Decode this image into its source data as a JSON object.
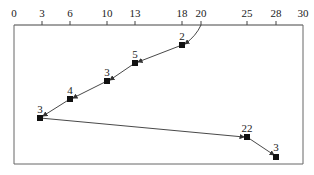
{
  "axis": {
    "ticks": [
      {
        "value": "0",
        "x": 14
      },
      {
        "value": "3",
        "x": 42
      },
      {
        "value": "6",
        "x": 70
      },
      {
        "value": "10",
        "x": 107
      },
      {
        "value": "13",
        "x": 135
      },
      {
        "value": "18",
        "x": 182
      },
      {
        "value": "20",
        "x": 201
      },
      {
        "value": "25",
        "x": 247
      },
      {
        "value": "28",
        "x": 276
      },
      {
        "value": "30",
        "x": 303
      }
    ]
  },
  "path": {
    "start": {
      "x_value": 20
    },
    "points": [
      {
        "x_value": 18,
        "label": "2"
      },
      {
        "x_value": 13,
        "label": "5"
      },
      {
        "x_value": 10,
        "label": "3"
      },
      {
        "x_value": 6,
        "label": "4"
      },
      {
        "x_value": 3,
        "label": "3"
      },
      {
        "x_value": 25,
        "label": "22"
      },
      {
        "x_value": 28,
        "label": "3"
      }
    ]
  },
  "colors": {
    "line": "#333333",
    "marker": "#111111",
    "border": "#555555"
  }
}
